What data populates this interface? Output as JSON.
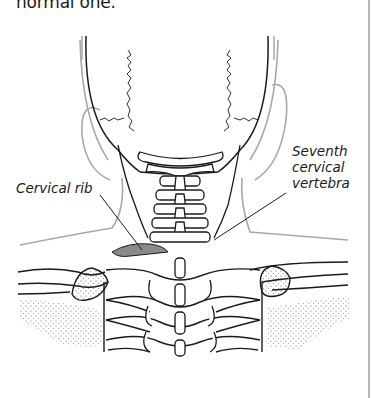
{
  "text": {
    "intro_fragment": "normal one."
  },
  "figure": {
    "labels": {
      "cervical_rib": "Cervical rib",
      "seventh_vertebra": [
        "Seventh",
        "cervical",
        "vertebra"
      ]
    },
    "highlight": {
      "cervical_rib_fill": "#8a8a8a"
    }
  },
  "colors": {
    "ink": "#1a1a1a",
    "soft_outline": "#a8a8a8",
    "divider": "#b8b8b8",
    "background": "#ffffff"
  }
}
